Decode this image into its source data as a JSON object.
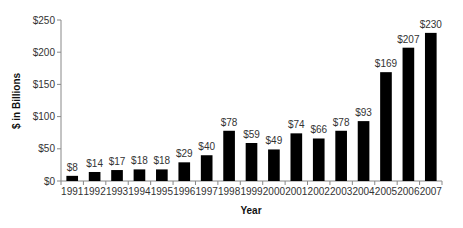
{
  "chart_data": {
    "type": "bar",
    "title": "",
    "xlabel": "Year",
    "ylabel": "$ in Billions",
    "ylim": [
      0,
      250
    ],
    "yticks": [
      0,
      50,
      100,
      150,
      200,
      250
    ],
    "ytick_labels": [
      "$0",
      "$50",
      "$100",
      "$150",
      "$200",
      "$250"
    ],
    "grid": false,
    "legend": null,
    "categories": [
      "1991",
      "1992",
      "1993",
      "1994",
      "1995",
      "1996",
      "1997",
      "1998",
      "1999",
      "2000",
      "2001",
      "2002",
      "2003",
      "2004",
      "2005",
      "2006",
      "2007"
    ],
    "values": [
      8,
      14,
      17,
      18,
      18,
      29,
      40,
      78,
      59,
      49,
      74,
      66,
      78,
      93,
      169,
      207,
      230
    ],
    "data_labels": [
      "$8",
      "$14",
      "$17",
      "$18",
      "$18",
      "$29",
      "$40",
      "$78",
      "$59",
      "$49",
      "$74",
      "$66",
      "$78",
      "$93",
      "$169",
      "$207",
      "$230"
    ],
    "bar_color": "#000000"
  }
}
